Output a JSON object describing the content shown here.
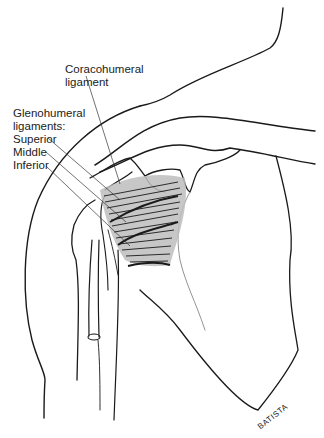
{
  "figure": {
    "labels": {
      "coracohumeral_line1": "Coracohumeral",
      "coracohumeral_line2": "ligament",
      "glenohumeral_line1": "Glenohumeral",
      "glenohumeral_line2": "ligaments:",
      "superior": "Superior",
      "middle": "Middle",
      "inferior": "Inferior"
    },
    "signature": "BATISTA",
    "colors": {
      "line": "#1a1a1a",
      "ligament_fill": "#bdbdbd",
      "background": "#ffffff"
    }
  }
}
